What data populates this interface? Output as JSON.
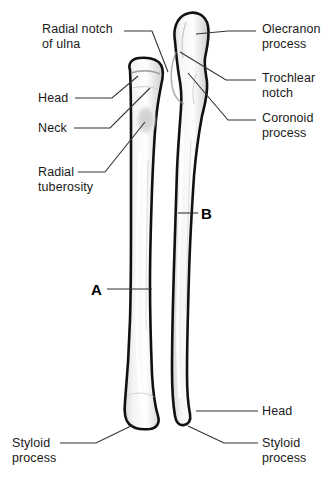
{
  "figure": {
    "background_color": "#ffffff",
    "bone_fill_color": "#ececec",
    "bone_outline_color": "#111111",
    "leader_line_color": "#333333",
    "text_color": "#1a1a1a"
  },
  "labels": {
    "radial_notch": "Radial notch\nof ulna",
    "head_left": "Head",
    "neck": "Neck",
    "radial_tuberosity": "Radial\ntuberosity",
    "styloid_process_left": "Styloid\nprocess",
    "olecranon_process": "Olecranon\nprocess",
    "trochlear_notch": "Trochlear\nnotch",
    "coronoid_process": "Coronoid\nprocess",
    "head_right": "Head",
    "styloid_process_right": "Styloid\nprocess"
  },
  "markers": {
    "a": "A",
    "b": "B"
  }
}
